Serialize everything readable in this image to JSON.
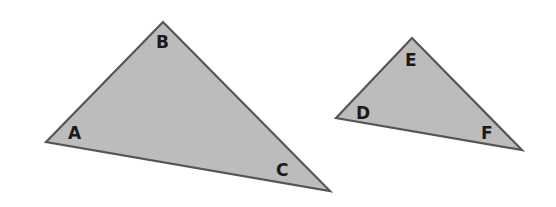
{
  "diagram": {
    "colors": {
      "fill": "#bcbcbc",
      "stroke": "#555555",
      "label": "#1a1a1a",
      "background": "#ffffff"
    },
    "triangles": [
      {
        "name": "ABC",
        "vertices": [
          {
            "label": "A",
            "x": 46,
            "y": 142,
            "label_x": 68,
            "label_y": 139
          },
          {
            "label": "B",
            "x": 163,
            "y": 22,
            "label_x": 156,
            "label_y": 48
          },
          {
            "label": "C",
            "x": 330,
            "y": 191,
            "label_x": 276,
            "label_y": 176
          }
        ]
      },
      {
        "name": "DEF",
        "vertices": [
          {
            "label": "D",
            "x": 336,
            "y": 118,
            "label_x": 356,
            "label_y": 119
          },
          {
            "label": "E",
            "x": 412,
            "y": 38,
            "label_x": 405,
            "label_y": 66
          },
          {
            "label": "F",
            "x": 522,
            "y": 150,
            "label_x": 481,
            "label_y": 139
          }
        ]
      }
    ]
  }
}
